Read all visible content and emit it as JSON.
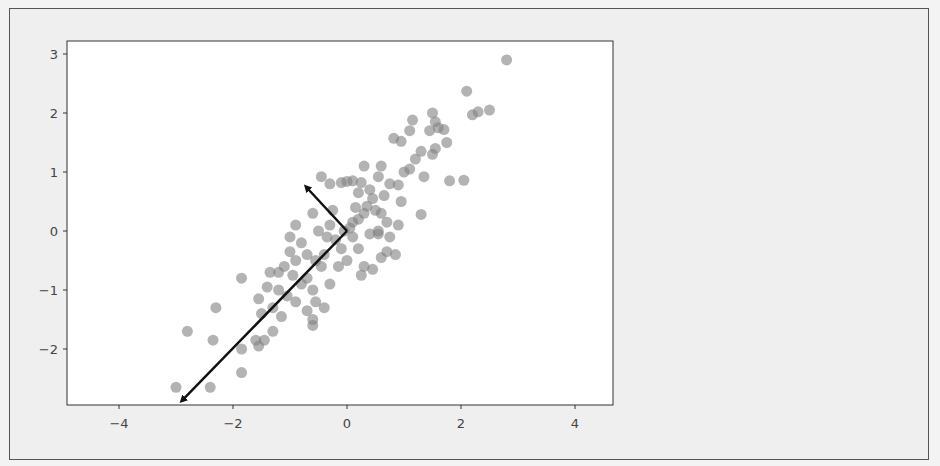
{
  "figure": {
    "background": "#efefef",
    "axes_background": "#ffffff",
    "point_color": "#808080",
    "point_alpha": 0.6,
    "arrow_color": "#111111"
  },
  "chart_data": {
    "type": "scatter",
    "title": "",
    "xlabel": "",
    "ylabel": "",
    "xlim": [
      -4.9,
      4.6
    ],
    "ylim": [
      -3.0,
      3.2
    ],
    "grid": false,
    "legend": null,
    "x_ticks": [
      -4,
      -2,
      0,
      2,
      4
    ],
    "x_tick_labels": [
      "−4",
      "−2",
      "0",
      "2",
      "4"
    ],
    "y_ticks": [
      3,
      2,
      1,
      0,
      -1,
      -2
    ],
    "y_tick_labels": [
      "3",
      "2",
      "1",
      "0",
      "−1",
      "−2"
    ],
    "arrows": [
      {
        "name": "principal-component-1",
        "from": [
          0,
          0
        ],
        "to": [
          -2.9,
          -2.88
        ]
      },
      {
        "name": "principal-component-2",
        "from": [
          0,
          0
        ],
        "to": [
          -0.72,
          0.75
        ]
      }
    ],
    "points": [
      [
        2.8,
        2.9
      ],
      [
        2.1,
        2.37
      ],
      [
        2.5,
        2.05
      ],
      [
        2.3,
        2.02
      ],
      [
        2.2,
        1.97
      ],
      [
        1.5,
        2.0
      ],
      [
        1.55,
        1.85
      ],
      [
        1.6,
        1.75
      ],
      [
        1.7,
        1.72
      ],
      [
        1.45,
        1.7
      ],
      [
        1.15,
        1.88
      ],
      [
        1.1,
        1.7
      ],
      [
        0.95,
        1.52
      ],
      [
        1.3,
        1.35
      ],
      [
        1.2,
        1.22
      ],
      [
        1.75,
        1.5
      ],
      [
        1.55,
        1.4
      ],
      [
        1.5,
        1.3
      ],
      [
        0.82,
        1.57
      ],
      [
        1.8,
        0.85
      ],
      [
        2.05,
        0.86
      ],
      [
        1.1,
        1.05
      ],
      [
        1.35,
        0.92
      ],
      [
        0.6,
        1.1
      ],
      [
        0.55,
        0.92
      ],
      [
        1.0,
        1.0
      ],
      [
        0.75,
        0.8
      ],
      [
        0.9,
        0.78
      ],
      [
        0.65,
        0.6
      ],
      [
        1.3,
        0.28
      ],
      [
        0.95,
        0.5
      ],
      [
        0.3,
        1.1
      ],
      [
        0.25,
        0.82
      ],
      [
        0.1,
        0.85
      ],
      [
        0.0,
        0.84
      ],
      [
        -0.1,
        0.82
      ],
      [
        -0.45,
        0.92
      ],
      [
        -0.3,
        0.8
      ],
      [
        0.4,
        0.7
      ],
      [
        0.2,
        0.65
      ],
      [
        0.45,
        0.55
      ],
      [
        0.35,
        0.42
      ],
      [
        0.5,
        0.35
      ],
      [
        0.6,
        0.3
      ],
      [
        0.3,
        0.3
      ],
      [
        0.2,
        0.2
      ],
      [
        0.1,
        0.15
      ],
      [
        0.05,
        0.05
      ],
      [
        -0.05,
        0.0
      ],
      [
        0.7,
        0.15
      ],
      [
        0.9,
        0.1
      ],
      [
        0.75,
        -0.1
      ],
      [
        0.55,
        -0.05
      ],
      [
        0.4,
        -0.05
      ],
      [
        0.85,
        -0.4
      ],
      [
        0.7,
        -0.35
      ],
      [
        0.6,
        -0.45
      ],
      [
        0.2,
        -0.3
      ],
      [
        0.3,
        -0.6
      ],
      [
        0.25,
        -0.75
      ],
      [
        0.45,
        -0.65
      ],
      [
        0.0,
        -0.5
      ],
      [
        -0.1,
        -0.3
      ],
      [
        -0.2,
        -0.15
      ],
      [
        -0.35,
        -0.1
      ],
      [
        -0.5,
        0.0
      ],
      [
        -0.3,
        0.1
      ],
      [
        -0.6,
        0.3
      ],
      [
        -0.9,
        0.1
      ],
      [
        -1.0,
        -0.1
      ],
      [
        -0.8,
        -0.2
      ],
      [
        -0.7,
        -0.4
      ],
      [
        -0.55,
        -0.5
      ],
      [
        -0.45,
        -0.6
      ],
      [
        -0.4,
        -0.4
      ],
      [
        -0.9,
        -0.5
      ],
      [
        -1.1,
        -0.6
      ],
      [
        -0.95,
        -0.75
      ],
      [
        -1.2,
        -0.7
      ],
      [
        -1.35,
        -0.7
      ],
      [
        -0.7,
        -0.8
      ],
      [
        -0.8,
        -0.9
      ],
      [
        -0.6,
        -1.0
      ],
      [
        -0.55,
        -1.2
      ],
      [
        -0.4,
        -1.3
      ],
      [
        -0.7,
        -1.35
      ],
      [
        -0.6,
        -1.5
      ],
      [
        -0.6,
        -1.6
      ],
      [
        -0.9,
        -1.2
      ],
      [
        -1.05,
        -1.1
      ],
      [
        -1.2,
        -1.0
      ],
      [
        -1.4,
        -0.95
      ],
      [
        -1.55,
        -1.15
      ],
      [
        -1.3,
        -1.3
      ],
      [
        -1.15,
        -1.45
      ],
      [
        -1.5,
        -1.4
      ],
      [
        -1.3,
        -1.7
      ],
      [
        -1.45,
        -1.85
      ],
      [
        -1.6,
        -1.85
      ],
      [
        -1.55,
        -1.95
      ],
      [
        -1.85,
        -0.8
      ],
      [
        -2.3,
        -1.3
      ],
      [
        -2.8,
        -1.7
      ],
      [
        -2.35,
        -1.85
      ],
      [
        -1.85,
        -2.0
      ],
      [
        -1.85,
        -2.4
      ],
      [
        -3.0,
        -2.65
      ],
      [
        -2.4,
        -2.65
      ],
      [
        -1.0,
        -0.35
      ],
      [
        -0.25,
        0.35
      ],
      [
        0.15,
        0.4
      ],
      [
        0.55,
        0.0
      ],
      [
        -0.15,
        -0.6
      ],
      [
        -0.3,
        -0.9
      ],
      [
        0.1,
        -0.1
      ]
    ]
  }
}
